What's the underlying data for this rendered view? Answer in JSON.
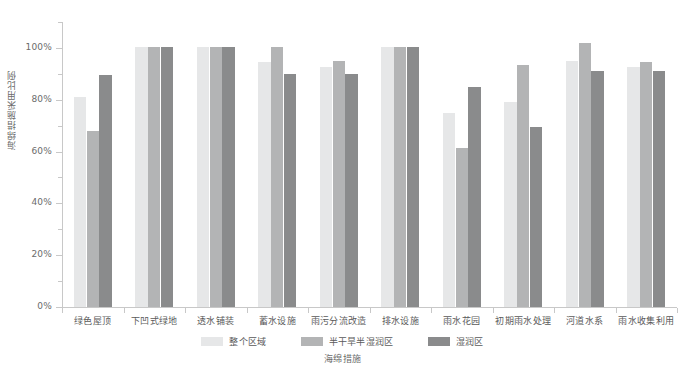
{
  "chart_data": {
    "type": "bar",
    "title": "",
    "xlabel": "海绵措施",
    "ylabel": "海绵措施采用比例",
    "ylim": [
      0,
      110
    ],
    "ytick_labels": [
      "0%",
      "20%",
      "40%",
      "60%",
      "80%",
      "100%"
    ],
    "ytick_values": [
      0,
      20,
      40,
      60,
      80,
      100
    ],
    "grid": false,
    "legend_position": "bottom",
    "categories": [
      "绿色屋顶",
      "下凹式绿地",
      "透水铺装",
      "蓄水设施",
      "雨污分流改造",
      "排水设施",
      "雨水花园",
      "初期雨水处理",
      "河道水系",
      "雨水收集利用"
    ],
    "series": [
      {
        "name": "整个区域",
        "color": "#e6e7e8",
        "values": [
          81,
          100.5,
          100.5,
          94.5,
          92.5,
          100.5,
          75,
          79,
          95,
          92.5
        ]
      },
      {
        "name": "半干旱半湿润区",
        "color": "#b3b4b5",
        "values": [
          68,
          100.5,
          100.5,
          100.5,
          95,
          100.5,
          61.5,
          93.5,
          102,
          94.5
        ]
      },
      {
        "name": "湿润区",
        "color": "#8a8b8c",
        "values": [
          89.5,
          100.5,
          100.5,
          90,
          90,
          100.5,
          85,
          69.5,
          91,
          91
        ]
      }
    ]
  },
  "axis": {
    "y_line_color": "#c8c8c8",
    "x_line_color": "#c8c8c8"
  }
}
